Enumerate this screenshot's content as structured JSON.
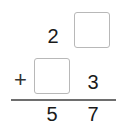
{
  "problem": {
    "operator": "+",
    "row1": {
      "tens": "2",
      "ones": ""
    },
    "row2": {
      "tens": "",
      "ones": "3"
    },
    "result": {
      "tens": "5",
      "ones": "7"
    },
    "blank_color": "#b8b8b8"
  }
}
